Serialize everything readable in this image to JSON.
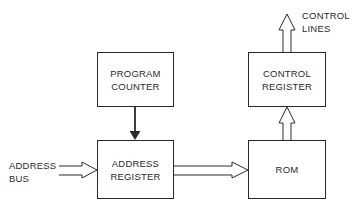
{
  "diagram": {
    "type": "block-diagram",
    "blocks": [
      {
        "id": "program_counter",
        "lines": [
          "PROGRAM",
          "COUNTER"
        ]
      },
      {
        "id": "address_register",
        "lines": [
          "ADDRESS",
          "REGISTER"
        ]
      },
      {
        "id": "control_register",
        "lines": [
          "CONTROL",
          "REGISTER"
        ]
      },
      {
        "id": "rom",
        "lines": [
          "ROM"
        ]
      }
    ],
    "external_labels": {
      "address_bus": [
        "ADDRESS",
        "BUS"
      ],
      "control_lines": [
        "CONTROL",
        "LINES"
      ]
    },
    "connections": [
      {
        "from": "address_bus",
        "to": "address_register",
        "style": "hollow-bus-arrow"
      },
      {
        "from": "program_counter",
        "to": "address_register",
        "style": "solid-arrow"
      },
      {
        "from": "address_register",
        "to": "rom",
        "style": "hollow-bus-arrow"
      },
      {
        "from": "rom",
        "to": "control_register",
        "style": "hollow-bus-arrow"
      },
      {
        "from": "control_register",
        "to": "control_lines",
        "style": "hollow-bus-arrow"
      }
    ],
    "colors": {
      "line": "#2a2a2a",
      "background": "#ffffff"
    }
  }
}
